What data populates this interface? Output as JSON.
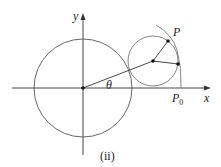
{
  "diagram": {
    "caption": "(ii)",
    "labels": {
      "x_axis": "x",
      "y_axis": "y",
      "angle": "θ",
      "point_p": "P",
      "point_p0": "P",
      "point_p0_sub": "0"
    },
    "colors": {
      "stroke": "#333333",
      "circle_stroke": "#666666",
      "background": "#ffffff"
    }
  }
}
